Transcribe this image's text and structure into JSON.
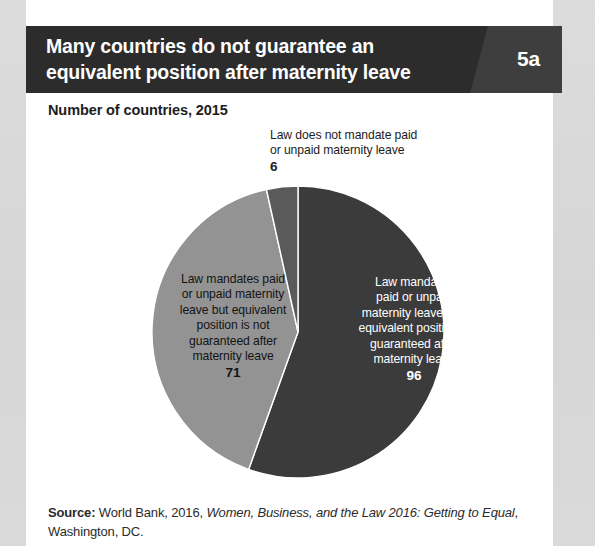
{
  "header": {
    "title_line1": "Many countries do not guarantee an",
    "title_line2": "equivalent position after maternity leave",
    "badge": "5a",
    "band_color": "#2c2c2c",
    "panel_color": "#3e3e3e"
  },
  "subtitle": "Number of countries, 2015",
  "chart_data": {
    "type": "pie",
    "title": "Many countries do not guarantee an equivalent position after maternity leave",
    "subtitle": "Number of countries, 2015",
    "unit": "number of countries",
    "total": 173,
    "legend": "none (labels placed on/near slices)",
    "start_angle_deg": 0,
    "direction": "clockwise",
    "categories": [
      "Law mandates paid or unpaid maternity leave and equivalent position is guaranteed after maternity leave",
      "Law mandates paid or unpaid maternity leave but equivalent position is not guaranteed after maternity leave",
      "Law does not mandate paid or unpaid maternity leave"
    ],
    "values": [
      96,
      71,
      6
    ],
    "colors": [
      "#3b3b3b",
      "#939393",
      "#5a5a5a"
    ],
    "slices": [
      {
        "name": "guaranteed",
        "value": 96,
        "percent": 55.5,
        "color": "#3b3b3b",
        "label_lines": [
          "Law mandates",
          "paid or unpaid",
          "maternity leave and",
          "equivalent position is",
          "guaranteed after",
          "maternity leave"
        ],
        "label_value": "96",
        "label_color": "#ffffff",
        "label_placement": "inside"
      },
      {
        "name": "not-guaranteed",
        "value": 71,
        "percent": 41.0,
        "color": "#939393",
        "label_lines": [
          "Law mandates paid",
          "or unpaid maternity",
          "leave but equivalent",
          "position is not",
          "guaranteed after",
          "maternity leave"
        ],
        "label_value": "71",
        "label_color": "#141414",
        "label_placement": "inside"
      },
      {
        "name": "no-mandate",
        "value": 6,
        "percent": 3.5,
        "color": "#5a5a5a",
        "label_lines": [
          "Law does not mandate paid",
          "or unpaid maternity leave"
        ],
        "label_value": "6",
        "label_color": "#1d1d1d",
        "label_placement": "outside-top"
      }
    ]
  },
  "source": {
    "label": "Source:",
    "text_before": " World Bank, 2016, ",
    "italic": "Women, Business, and the Law 2016: Getting to Equal",
    "text_after": ", Washington, DC."
  }
}
